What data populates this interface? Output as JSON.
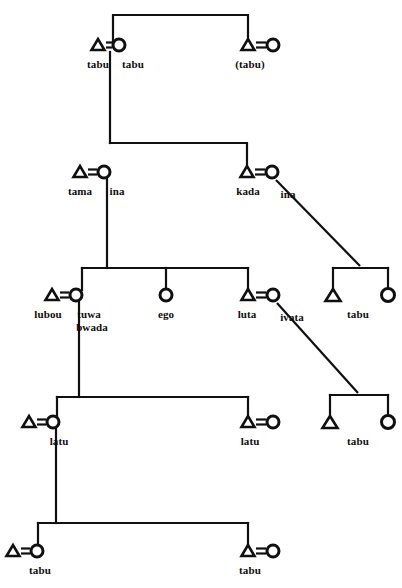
{
  "diagram": {
    "type": "genealogical-kinship-diagram",
    "line_color": "#101010",
    "background_color": "#ffffff",
    "symbol_legend": {
      "triangle": "male",
      "circle": "female",
      "equals": "marriage-link",
      "horizontal-bar": "sibling-link",
      "vertical-line": "descent-link",
      "diagonal-line": "descent-link-oblique"
    },
    "generations": [
      {
        "id": "generation-1",
        "persons": [
          {
            "id": "g1-male-1",
            "symbol": "triangle",
            "label": "tabu",
            "sex": "male"
          },
          {
            "id": "g1-female-1",
            "symbol": "circle",
            "label": "tabu",
            "sex": "female"
          },
          {
            "id": "g1-male-2",
            "symbol": "triangle",
            "label": "(tabu)",
            "sex": "male"
          },
          {
            "id": "g1-female-2",
            "symbol": "circle",
            "label": "",
            "sex": "female"
          }
        ]
      },
      {
        "id": "generation-2",
        "persons": [
          {
            "id": "g2-male-1",
            "symbol": "triangle",
            "label": "tama",
            "sex": "male"
          },
          {
            "id": "g2-female-1",
            "symbol": "circle",
            "label": "ina",
            "sex": "female"
          },
          {
            "id": "g2-male-2",
            "symbol": "triangle",
            "label": "kada",
            "sex": "male"
          },
          {
            "id": "g2-female-2",
            "symbol": "circle",
            "label": "ina",
            "sex": "female"
          }
        ]
      },
      {
        "id": "generation-3",
        "persons": [
          {
            "id": "g3-male-1",
            "symbol": "triangle",
            "label": "lubou",
            "sex": "male"
          },
          {
            "id": "g3-female-1",
            "symbol": "circle",
            "label": "tuwa\nbwada",
            "sex": "female"
          },
          {
            "id": "g3-ego",
            "symbol": "circle",
            "label": "ego",
            "sex": "female"
          },
          {
            "id": "g3-male-2",
            "symbol": "triangle",
            "label": "luta",
            "sex": "male"
          },
          {
            "id": "g3-female-2",
            "symbol": "circle",
            "label": "ivata",
            "sex": "female"
          },
          {
            "id": "g3-male-3",
            "symbol": "triangle",
            "label": "",
            "sex": "male"
          },
          {
            "id": "g3-female-3",
            "symbol": "circle",
            "label": "",
            "sex": "female"
          },
          {
            "id": "g3-pair-label",
            "symbol": "group-label",
            "label": "tabu",
            "sex": ""
          }
        ]
      },
      {
        "id": "generation-4",
        "persons": [
          {
            "id": "g4-male-1",
            "symbol": "triangle",
            "label": "",
            "sex": "male"
          },
          {
            "id": "g4-female-1",
            "symbol": "circle",
            "label": "latu",
            "sex": "female"
          },
          {
            "id": "g4-male-2",
            "symbol": "triangle",
            "label": "latu",
            "sex": "male"
          },
          {
            "id": "g4-female-2",
            "symbol": "circle",
            "label": "",
            "sex": "female"
          },
          {
            "id": "g4-male-3",
            "symbol": "triangle",
            "label": "",
            "sex": "male"
          },
          {
            "id": "g4-female-3",
            "symbol": "circle",
            "label": "",
            "sex": "female"
          },
          {
            "id": "g4-pair-label",
            "symbol": "group-label",
            "label": "tabu",
            "sex": ""
          }
        ]
      },
      {
        "id": "generation-5",
        "persons": [
          {
            "id": "g5-male-1",
            "symbol": "triangle",
            "label": "",
            "sex": "male"
          },
          {
            "id": "g5-female-1",
            "symbol": "circle",
            "label": "tabu",
            "sex": "female"
          },
          {
            "id": "g5-male-2",
            "symbol": "triangle",
            "label": "tabu",
            "sex": "male"
          },
          {
            "id": "g5-female-2",
            "symbol": "circle",
            "label": "",
            "sex": "female"
          }
        ]
      }
    ],
    "labels": {
      "g1_left_male": "tabu",
      "g1_left_female": "tabu",
      "g1_right_male": "(tabu)",
      "g2_left_male": "tama",
      "g2_left_female": "ina",
      "g2_right_male": "kada",
      "g2_right_female": "ina",
      "g3_left_male": "lubou",
      "g3_left_female_line1": "tuwa",
      "g3_left_female_line2": "bwada",
      "g3_ego": "ego",
      "g3_right_male": "luta",
      "g3_right_female": "ivata",
      "g3_far_right_pair": "tabu",
      "g4_left_female": "latu",
      "g4_right_male": "latu",
      "g4_far_right_pair": "tabu",
      "g5_left_female": "tabu",
      "g5_right_male": "tabu"
    }
  }
}
